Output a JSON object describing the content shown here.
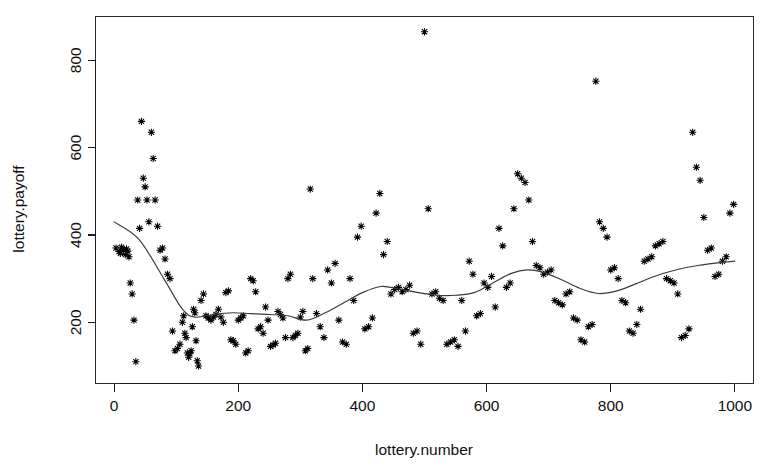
{
  "figure": {
    "background_color": "#ffffff",
    "foreground_color": "#000000",
    "width": 763,
    "height": 475
  },
  "chart_data": {
    "type": "scatter",
    "title": "",
    "subtitle": "",
    "xlabel": "lottery.number",
    "ylabel": "lottery.payoff",
    "xlim": [
      -30,
      1030
    ],
    "ylim": [
      60,
      900
    ],
    "xticks": [
      0,
      200,
      400,
      600,
      800,
      1000
    ],
    "yticks": [
      200,
      400,
      600,
      800
    ],
    "xtick_labels": [
      "0",
      "200",
      "400",
      "600",
      "800",
      "1000"
    ],
    "ytick_labels": [
      "200",
      "400",
      "600",
      "800"
    ],
    "grid": false,
    "legend": false,
    "legend_position": "none",
    "marker": "star",
    "marker_color": "#000000",
    "annotations": [],
    "series": [
      {
        "name": "lottery.payoff vs lottery.number",
        "type": "scatter",
        "marker": "star",
        "color": "#000000",
        "x": [
          3,
          8,
          10,
          12,
          15,
          18,
          20,
          22,
          24,
          26,
          29,
          32,
          35,
          38,
          41,
          44,
          47,
          50,
          53,
          56,
          60,
          63,
          66,
          70,
          74,
          78,
          82,
          86,
          90,
          94,
          98,
          102,
          106,
          110,
          112,
          114,
          116,
          118,
          120,
          122,
          124,
          126,
          128,
          130,
          132,
          134,
          136,
          140,
          144,
          148,
          152,
          156,
          160,
          164,
          168,
          172,
          176,
          180,
          184,
          188,
          192,
          196,
          200,
          204,
          208,
          212,
          216,
          220,
          224,
          228,
          232,
          236,
          240,
          244,
          248,
          252,
          256,
          260,
          264,
          268,
          272,
          276,
          280,
          284,
          288,
          292,
          296,
          300,
          304,
          308,
          312,
          316,
          320,
          326,
          332,
          338,
          344,
          350,
          356,
          362,
          368,
          374,
          380,
          386,
          392,
          398,
          404,
          410,
          416,
          422,
          428,
          434,
          440,
          446,
          452,
          458,
          464,
          470,
          476,
          482,
          488,
          494,
          500,
          506,
          512,
          518,
          524,
          530,
          536,
          542,
          548,
          554,
          560,
          566,
          572,
          578,
          584,
          590,
          596,
          602,
          608,
          614,
          620,
          626,
          632,
          638,
          644,
          650,
          656,
          662,
          668,
          674,
          680,
          686,
          692,
          698,
          704,
          710,
          716,
          722,
          728,
          734,
          740,
          746,
          752,
          758,
          764,
          770,
          776,
          782,
          788,
          794,
          800,
          806,
          812,
          818,
          824,
          830,
          836,
          842,
          848,
          854,
          860,
          866,
          872,
          878,
          884,
          890,
          896,
          902,
          908,
          914,
          920,
          926,
          932,
          938,
          944,
          950,
          956,
          962,
          968,
          974,
          980,
          986,
          992,
          998
        ],
        "y": [
          370,
          362,
          358,
          372,
          366,
          355,
          368,
          363,
          350,
          290,
          265,
          205,
          110,
          480,
          415,
          660,
          530,
          510,
          480,
          430,
          635,
          575,
          480,
          420,
          365,
          370,
          345,
          310,
          300,
          180,
          135,
          140,
          150,
          200,
          215,
          175,
          165,
          130,
          120,
          128,
          135,
          190,
          230,
          222,
          158,
          112,
          100,
          250,
          265,
          215,
          210,
          205,
          212,
          218,
          230,
          212,
          200,
          268,
          272,
          160,
          158,
          150,
          205,
          210,
          215,
          130,
          135,
          300,
          295,
          270,
          185,
          190,
          175,
          235,
          205,
          145,
          148,
          152,
          225,
          218,
          210,
          165,
          300,
          310,
          165,
          170,
          175,
          212,
          225,
          135,
          140,
          505,
          300,
          220,
          190,
          165,
          320,
          290,
          335,
          205,
          155,
          150,
          300,
          250,
          395,
          420,
          185,
          190,
          210,
          450,
          495,
          355,
          385,
          265,
          275,
          280,
          270,
          275,
          285,
          175,
          180,
          150,
          865,
          460,
          265,
          270,
          255,
          250,
          150,
          155,
          160,
          145,
          250,
          180,
          340,
          310,
          215,
          220,
          290,
          280,
          305,
          235,
          415,
          375,
          280,
          290,
          460,
          540,
          530,
          520,
          480,
          385,
          330,
          325,
          310,
          315,
          320,
          250,
          245,
          240,
          265,
          270,
          210,
          205,
          160,
          155,
          190,
          195,
          752,
          430,
          415,
          395,
          320,
          325,
          300,
          250,
          245,
          180,
          175,
          195,
          230,
          340,
          345,
          350,
          375,
          380,
          385,
          300,
          295,
          290,
          265,
          165,
          170,
          185,
          635,
          555,
          525,
          440,
          365,
          370,
          305,
          310,
          340,
          350,
          450,
          470
        ]
      }
    ],
    "smoother": {
      "name": "lowess smoother",
      "type": "line",
      "color": "#3a3a3a",
      "x": [
        0,
        40,
        80,
        110,
        130,
        160,
        190,
        220,
        250,
        280,
        310,
        340,
        370,
        400,
        430,
        460,
        490,
        520,
        550,
        580,
        610,
        640,
        665,
        690,
        720,
        750,
        780,
        810,
        840,
        870,
        900,
        940,
        1000
      ],
      "y": [
        430,
        390,
        300,
        230,
        212,
        218,
        222,
        220,
        218,
        215,
        205,
        222,
        245,
        268,
        282,
        276,
        268,
        262,
        262,
        268,
        290,
        312,
        320,
        315,
        298,
        278,
        266,
        272,
        288,
        305,
        318,
        330,
        340
      ]
    }
  }
}
